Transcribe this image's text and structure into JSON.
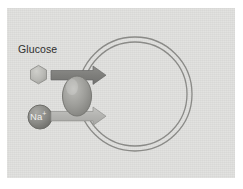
{
  "figure": {
    "panel_background": "#dcdcda",
    "page_background": "#ffffff"
  },
  "labels": {
    "glucose": "Glucose",
    "sodium_text": "Na",
    "sodium_charge": "+"
  },
  "molecules": [
    {
      "id": "glucose",
      "name": "Glucose",
      "shape": "hexagon",
      "fill": "#b9b9b6",
      "stroke": "#8e8e8b"
    },
    {
      "id": "sodium",
      "name": "Na+",
      "shape": "circle",
      "fill": "#8d8d8a",
      "stroke": "#6e6e6b"
    }
  ],
  "membrane": {
    "name": "cell-membrane",
    "shape": "double-line-circle",
    "stroke": "#8a8a87",
    "center_x": 128,
    "center_y": 86,
    "radius_outer": 57,
    "radius_inner": 52
  },
  "transporter": {
    "name": "cotransporter-protein",
    "shape": "ellipse",
    "fill": "#9a9a96",
    "stroke": "#797975"
  },
  "arrows": [
    {
      "id": "glucose-arrow",
      "label": "Glucose transport direction",
      "direction": "right",
      "fill": "#828280",
      "stroke": "#6a6a68"
    },
    {
      "id": "sodium-arrow",
      "label": "Sodium transport direction",
      "direction": "right",
      "fill": "#b4b4b1",
      "stroke": "#90908d"
    }
  ]
}
